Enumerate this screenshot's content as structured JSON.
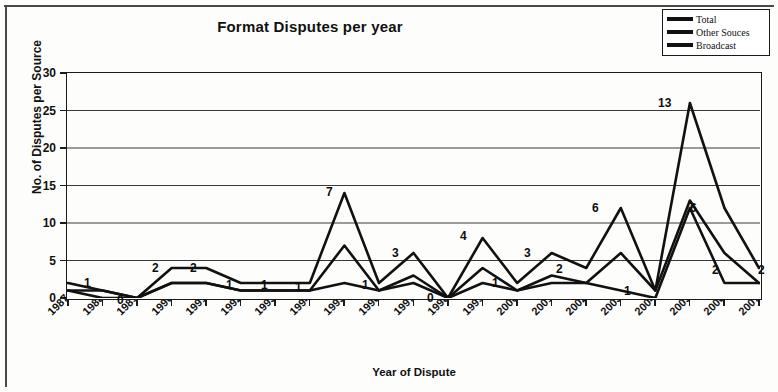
{
  "chart_data": {
    "type": "line",
    "title": "Format Disputes per year",
    "xlabel": "Year of Dispute",
    "ylabel": "No. of Disputes per Source",
    "grid": true,
    "legend_position": "top-right",
    "ylim": [
      0,
      30
    ],
    "yticks": [
      0,
      5,
      10,
      15,
      20,
      25,
      30
    ],
    "ytick_labels": [
      "0",
      "5",
      "10",
      "15",
      "20",
      "25",
      "30"
    ],
    "categories": [
      "1987",
      "1988",
      "1989",
      "1990",
      "1991",
      "1992",
      "1993",
      "1994",
      "1995",
      "1996",
      "1997",
      "1998",
      "1999",
      "2000",
      "2001",
      "2002",
      "2003",
      "2004",
      "2005",
      "2006",
      "2007"
    ],
    "series": [
      {
        "name": "Total",
        "values": [
          2,
          1,
          0,
          4,
          4,
          2,
          2,
          2,
          14,
          2,
          6,
          0,
          8,
          2,
          6,
          4,
          12,
          1,
          26,
          12,
          4
        ]
      },
      {
        "name": "Other Souces",
        "values": [
          1,
          0,
          0,
          2,
          2,
          1,
          1,
          1,
          7,
          1,
          3,
          0,
          4,
          1,
          3,
          2,
          6,
          1,
          13,
          6,
          2
        ]
      },
      {
        "name": "Broadcast",
        "values": [
          1,
          1,
          0,
          2,
          2,
          1,
          1,
          1,
          2,
          1,
          2,
          0,
          2,
          1,
          2,
          2,
          1,
          0,
          12,
          2,
          2
        ]
      }
    ],
    "point_labels": [
      {
        "text": "1",
        "year": "1987",
        "x": 84,
        "y": 277
      },
      {
        "text": "0",
        "year": "1989",
        "x": 117,
        "y": 294
      },
      {
        "text": "2",
        "year": "1990",
        "x": 152,
        "y": 262
      },
      {
        "text": "2",
        "year": "1991",
        "x": 190,
        "y": 262
      },
      {
        "text": "1",
        "year": "1992",
        "x": 226,
        "y": 279
      },
      {
        "text": "1",
        "year": "1993",
        "x": 261,
        "y": 279
      },
      {
        "text": "1",
        "year": "1994",
        "x": 295,
        "y": 281
      },
      {
        "text": "7",
        "year": "1995",
        "x": 326,
        "y": 186
      },
      {
        "text": "1",
        "year": "1996",
        "x": 362,
        "y": 279
      },
      {
        "text": "3",
        "year": "1997",
        "x": 392,
        "y": 247
      },
      {
        "text": "0",
        "year": "1998",
        "x": 427,
        "y": 292
      },
      {
        "text": "4",
        "year": "1999",
        "x": 460,
        "y": 230
      },
      {
        "text": "1",
        "year": "2000",
        "x": 492,
        "y": 277
      },
      {
        "text": "3",
        "year": "2001",
        "x": 524,
        "y": 247
      },
      {
        "text": "2",
        "year": "2002",
        "x": 556,
        "y": 263
      },
      {
        "text": "6",
        "year": "2003",
        "x": 592,
        "y": 202
      },
      {
        "text": "1",
        "year": "2004",
        "x": 624,
        "y": 285
      },
      {
        "text": "13",
        "year": "2005",
        "x": 658,
        "y": 97
      },
      {
        "text": "6",
        "year": "2006",
        "x": 690,
        "y": 202
      },
      {
        "text": "2",
        "year": "2007a",
        "x": 712,
        "y": 264
      },
      {
        "text": "2",
        "year": "2007b",
        "x": 758,
        "y": 264
      }
    ]
  },
  "legend": {
    "items": [
      {
        "label": "Total"
      },
      {
        "label": "Other  Souces"
      },
      {
        "label": "Broadcast"
      }
    ]
  },
  "colors": {
    "line": "#111111",
    "grid": "#3a3a3a",
    "axis": "#1a1a1a",
    "background": "#fdfdfc"
  }
}
